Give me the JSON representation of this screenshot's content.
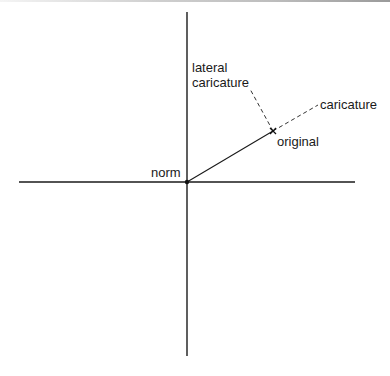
{
  "diagram": {
    "type": "vector-space",
    "labels": {
      "norm": "norm",
      "original": "original",
      "caricature": "caricature",
      "lateral_line1": "lateral",
      "lateral_line2": "caricature"
    },
    "colors": {
      "line": "#1a1a1a",
      "dashed": "#333333",
      "background": "#ffffff"
    },
    "points": {
      "norm": [
        187,
        182
      ],
      "original": [
        273,
        131
      ],
      "caricature_end": [
        318,
        105
      ],
      "lateral_end": [
        250,
        89
      ]
    },
    "axes": {
      "vertical": {
        "x": 187,
        "y1": 12,
        "y2": 356
      },
      "horizontal": {
        "y": 182,
        "x1": 19,
        "x2": 355
      }
    }
  }
}
